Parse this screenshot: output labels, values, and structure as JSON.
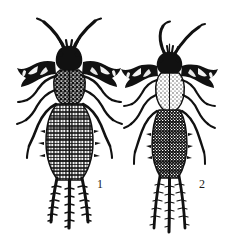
{
  "plate": {
    "kind": "scientific-line-illustration",
    "subject": "two insect nymphs, dorsal view",
    "background_color": "#ffffff",
    "ink_color": "#111111",
    "figures": [
      {
        "label": "1",
        "label_x": 97,
        "label_y": 178,
        "name": "insect-nymph-left",
        "description": "dorsal view of insect nymph with long straight diverging antennae, broad dark wing pads, six legs, segmented abdomen and three caudal filaments",
        "antennae": 2,
        "legs": 6,
        "caudal_filaments": 3,
        "wing_pads": 2,
        "body_width": "broad",
        "relative_size": "larger"
      },
      {
        "label": "2",
        "label_x": 199,
        "label_y": 178,
        "name": "insect-nymph-right",
        "description": "dorsal view of insect nymph with long curved inward-hooking antennae, dark wing pads, pale thorax, six legs, narrow segmented abdomen and three long caudal filaments",
        "antennae": 2,
        "legs": 6,
        "caudal_filaments": 3,
        "wing_pads": 2,
        "body_width": "narrow",
        "relative_size": "smaller"
      }
    ]
  }
}
